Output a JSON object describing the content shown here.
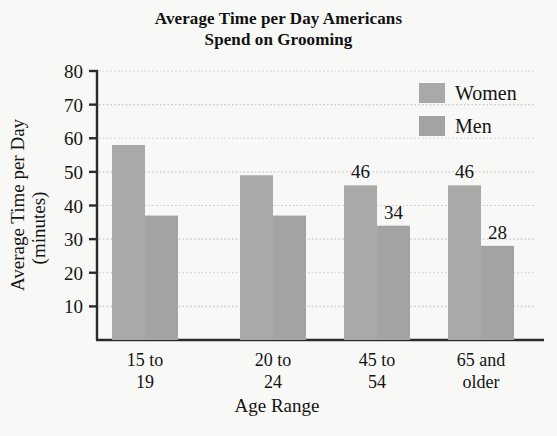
{
  "chart_data": {
    "type": "bar",
    "title": "Average Time per Day Americans Spend on Grooming",
    "title_lines": [
      "Average Time per Day Americans",
      "Spend on Grooming"
    ],
    "xlabel": "Age Range",
    "ylabel": "Average Time per Day",
    "ylabel_line2": "(minutes)",
    "categories": [
      "15 to 19",
      "20 to 24",
      "45 to 54",
      "65 and older"
    ],
    "category_lines": [
      [
        "15 to",
        "19"
      ],
      [
        "20 to",
        "24"
      ],
      [
        "45 to",
        "54"
      ],
      [
        "65 and",
        "older"
      ]
    ],
    "series": [
      {
        "name": "Women",
        "color": "#a9a9a7",
        "values": [
          58,
          49,
          46,
          46
        ],
        "labels": [
          "",
          "",
          "46",
          "46"
        ]
      },
      {
        "name": "Men",
        "color": "#a3a3a1",
        "values": [
          37,
          37,
          34,
          28
        ],
        "labels": [
          "",
          "",
          "34",
          "28"
        ]
      }
    ],
    "ylim": [
      0,
      80
    ],
    "yticks": [
      10,
      20,
      30,
      40,
      50,
      60,
      70,
      80
    ],
    "ytick_labels": [
      "10",
      "20",
      "30",
      "40",
      "50",
      "60",
      "70",
      "80"
    ],
    "grid": true,
    "grid_style": "dotted",
    "grid_color": "#c9c9c9",
    "legend_position": "top-right",
    "axis_color": "#2b2b2b",
    "background": "#f8f8f6"
  },
  "legend": {
    "entries": [
      {
        "label": "Women",
        "color": "#a9a9a7"
      },
      {
        "label": "Men",
        "color": "#a3a3a1"
      }
    ]
  }
}
